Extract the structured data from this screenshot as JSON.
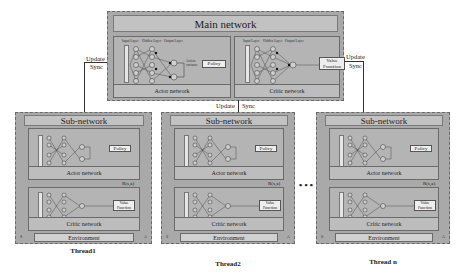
{
  "main": {
    "title": "Main network",
    "actor": {
      "label": "Actor network",
      "output": "Policy",
      "action_label": "Action\nvariance",
      "layers": [
        "Input Layer",
        "Hidden Layer",
        "Output Layer"
      ],
      "state_label": "State"
    },
    "critic": {
      "label": "Critic network",
      "output": "Value\nFunction",
      "layers": [
        "Input Layer",
        "Hidden Layer",
        "Output Layer"
      ],
      "state_label": "State"
    }
  },
  "arrows": {
    "left_update": "Update",
    "left_sync": "Sync",
    "center_update": "Update",
    "center_sync": "Sync",
    "right_update": "Update",
    "right_sync": "Sync"
  },
  "threads": [
    {
      "sub_title": "Sub-network",
      "actor_label": "Actor network",
      "actor_output": "Policy",
      "reward_label": "R(s,a)",
      "critic_label": "Critic network",
      "critic_output": "Value\nFunction",
      "environment": "Environment",
      "corner_left": "S",
      "corner_right": "A",
      "thread_label": "Thread1"
    },
    {
      "sub_title": "Sub-network",
      "actor_label": "Actor network",
      "actor_output": "Policy",
      "reward_label": "R(s,a)",
      "critic_label": "Critic network",
      "critic_output": "Value\nFunction",
      "environment": "Environment",
      "corner_left": "S",
      "corner_right": "A",
      "thread_label": "Thread2"
    },
    {
      "sub_title": "Sub-network",
      "actor_label": "Actor network",
      "actor_output": "Policy",
      "reward_label": "R(s,a)",
      "critic_label": "Critic network",
      "critic_output": "Value\nFunction",
      "environment": "Environment",
      "corner_left": "S",
      "corner_right": "A",
      "thread_label": "Thread n"
    }
  ],
  "ellipsis": "• • •",
  "colors": {
    "panel": "#a9a9a9",
    "title_bar": "#c2c2c2",
    "network": "#b4b4b4",
    "border": "#6a6a6a"
  }
}
